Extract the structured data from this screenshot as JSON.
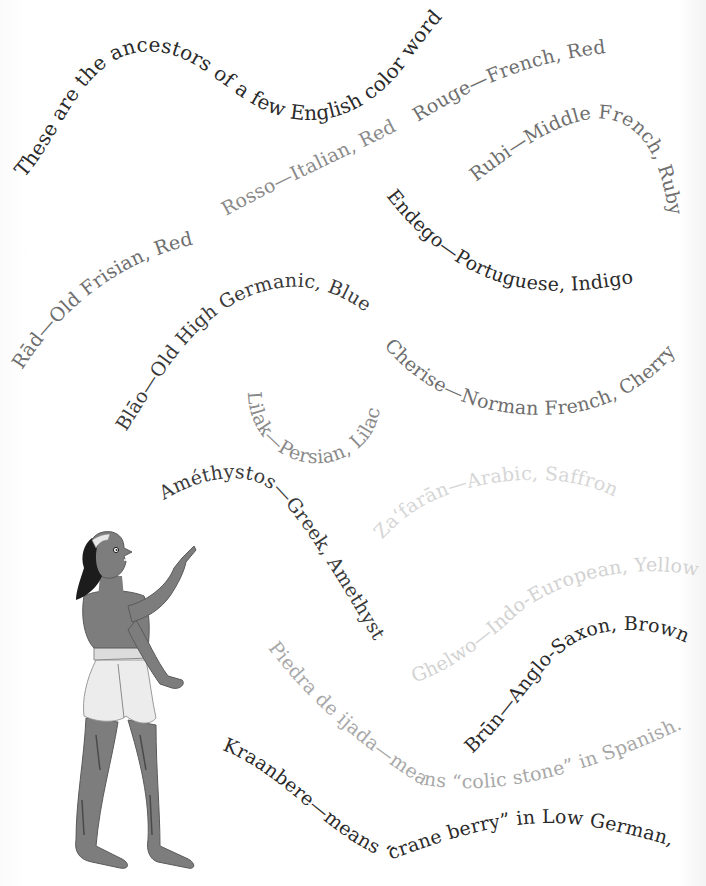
{
  "title": "These are the ancestors of a few English color words:",
  "colors": {
    "black": "#2a2a2a",
    "dark": "#3a3a3a",
    "mid": "#6e6e6e",
    "gray": "#8a8a8a",
    "light": "#b0b0b0",
    "faint": "#d2d2d2",
    "skin": "#7d7d7d",
    "skin_dark": "#555555",
    "hair": "#1c1c1c",
    "cloth": "#e6e6e6"
  },
  "phrases": [
    {
      "id": "title",
      "text": "These are the ancestors of a few English color words:",
      "tone": "black"
    },
    {
      "id": "rouge",
      "text": "Rouge—French, Red",
      "tone": "mid"
    },
    {
      "id": "rubi",
      "text": "Rubi—Middle French, Ruby",
      "tone": "mid"
    },
    {
      "id": "rosso",
      "text": "Rosso—Italian, Red",
      "tone": "gray"
    },
    {
      "id": "endego",
      "text": "Endego—Portuguese, Indigo",
      "tone": "black"
    },
    {
      "id": "rad",
      "text": "Rād—Old Frisian, Red",
      "tone": "mid"
    },
    {
      "id": "blao",
      "text": "Blāo—Old High Germanic, Blue",
      "tone": "dark"
    },
    {
      "id": "cherise",
      "text": "Cherise—Norman French, Cherry",
      "tone": "mid"
    },
    {
      "id": "lilak",
      "text": "Lilak—Persian, Lilac",
      "tone": "gray"
    },
    {
      "id": "amethystos",
      "text": "Améthystos—Greek, Amethyst",
      "tone": "dark"
    },
    {
      "id": "zafaran",
      "text": "Zaʻfarān—Arabic, Saffron",
      "tone": "faint"
    },
    {
      "id": "ghelwo",
      "text": "Ghelwo—Indo-European, Yellow",
      "tone": "faint"
    },
    {
      "id": "brun",
      "text": "Brūn—Anglo-Saxon, Brown",
      "tone": "black"
    },
    {
      "id": "piedra",
      "text": "Piedra de ijada—means “colic stone” in Spanish.",
      "tone": "light"
    },
    {
      "id": "kraanbere",
      "text": "Kraanbere—means “crane berry” in Low German,",
      "tone": "black"
    }
  ],
  "illustration": {
    "subject": "figure-pointing-up",
    "icon": "ancient-greek-figure-illustration"
  }
}
